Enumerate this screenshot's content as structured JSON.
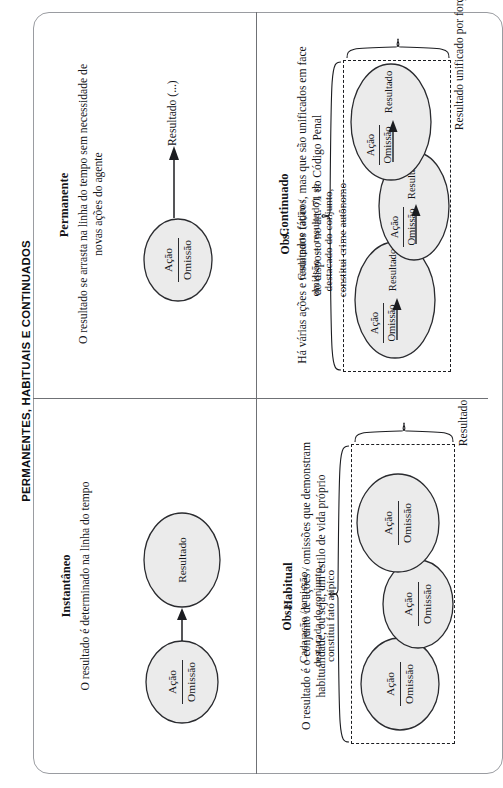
{
  "page": {
    "title": "PERMANENTES, HABITUAIS E CONTINUADOS",
    "background_color": "#ffffff",
    "frame_border_color": "#9a9ca1",
    "node_fill_color": "#ebebeb",
    "node_stroke_color": "#2a2b2f",
    "text_color": "#15161a"
  },
  "labels": {
    "acao": "Ação",
    "omissao": "Omissão",
    "resultado": "Resultado",
    "plus": "+"
  },
  "quadrants": {
    "permanente": {
      "title": "Permanente",
      "description": "O resultado se arrasta na linha do tempo sem necessidade de novas ações do agente",
      "node": {
        "top": "Ação",
        "bottom": "Omissão"
      },
      "outcome": "Resultado (...)"
    },
    "instantaneo": {
      "title": "Instantâneo",
      "description": "O resultado é determinado na linha do tempo",
      "node": {
        "top": "Ação",
        "bottom": "Omissão"
      },
      "outcome": "Resultado"
    },
    "continuado": {
      "title": "Continuado",
      "description": "Há várias ações e resultados fáticos, mas que são unificados em face do disposto no art. 71 do Código Penal",
      "obs_title": "Obs.:",
      "obs_body": "Cada parte (ação / omissão → resultado), se destacado do conjunto, constitui crime autônomo",
      "brace_label": "Resultado unificado por força de lei",
      "plus": "+",
      "groups": [
        {
          "top": "Ação",
          "bottom": "Omissão",
          "outcome": "Resultado"
        },
        {
          "top": "Ação",
          "bottom": "Omissão",
          "outcome": "Resultado"
        },
        {
          "top": "Ação",
          "bottom": "Omissão",
          "outcome": "Resultado"
        }
      ]
    },
    "habitual": {
      "title": "Habitual",
      "description": "O resultado é o conjunto de ações / omissões que demonstram habitualidade, ou seja, um estilo de vida próprio",
      "obs_title": "Obs.:",
      "obs_body": "Cada ação / omissão, destacada do conjunto, constitui fato atípico",
      "brace_label": "Resultado",
      "plus": "+",
      "groups": [
        {
          "top": "Ação",
          "bottom": "Omissão"
        },
        {
          "top": "Ação",
          "bottom": "Omissão"
        },
        {
          "top": "Ação",
          "bottom": "Omissão"
        }
      ]
    }
  }
}
